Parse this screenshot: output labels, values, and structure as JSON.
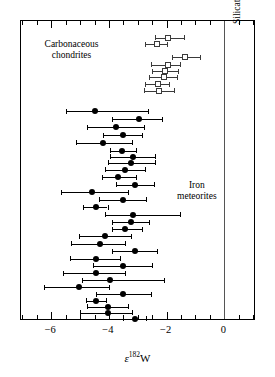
{
  "figure": {
    "background": "#ffffff",
    "frame_color": "#000000"
  },
  "axis": {
    "xlabel_epsilon": "ε",
    "xlabel_superscript": "182",
    "xlabel_element": "W",
    "xlabel_full": "ε182W",
    "tick_labels": [
      "−6",
      "−4",
      "−2",
      "0"
    ],
    "tick_values": [
      -6,
      -4,
      -2,
      0
    ],
    "xlim": [
      -7.05,
      1.1
    ],
    "minor_tick_step": 0.5
  },
  "annotations": {
    "carbonaceous": "Carbonaceous\nchondrites",
    "carbonaceous_line1": "Carbonaceous",
    "carbonaceous_line2": "chondrites",
    "iron": "Iron\nmeteorites",
    "iron_line1": "Iron",
    "iron_line2": "meteorites",
    "silicate_earth": "Silicate Earth"
  },
  "chart_data": {
    "type": "scatter",
    "title": "",
    "xlabel": "ε182W",
    "ylabel": "",
    "xlim": [
      -7.05,
      1.1
    ],
    "ylim": [
      0,
      1
    ],
    "grid": false,
    "legend": "none",
    "reference_lines": [
      {
        "name": "Silicate Earth",
        "x": 0,
        "color": "#555555"
      }
    ],
    "series": [
      {
        "name": "Carbonaceous chondrites",
        "marker": "open-square",
        "color": "#3a3a3a",
        "points": [
          {
            "x": -1.95,
            "y": 0.945,
            "xerr_low": 0.45,
            "xerr_high": 0.55
          },
          {
            "x": -2.35,
            "y": 0.922,
            "xerr_low": 0.4,
            "xerr_high": 0.35
          },
          {
            "x": -1.35,
            "y": 0.88,
            "xerr_low": 0.45,
            "xerr_high": 0.5
          },
          {
            "x": -1.95,
            "y": 0.855,
            "xerr_low": 0.6,
            "xerr_high": 0.4
          },
          {
            "x": -2.05,
            "y": 0.833,
            "xerr_low": 0.45,
            "xerr_high": 0.45
          },
          {
            "x": -2.1,
            "y": 0.812,
            "xerr_low": 0.5,
            "xerr_high": 0.45
          },
          {
            "x": -2.3,
            "y": 0.79,
            "xerr_low": 0.45,
            "xerr_high": 0.4
          },
          {
            "x": -2.25,
            "y": 0.768,
            "xerr_low": 0.55,
            "xerr_high": 0.5
          }
        ]
      },
      {
        "name": "Iron meteorites",
        "marker": "filled-circle",
        "color": "#000000",
        "points": [
          {
            "x": -4.5,
            "y": 0.7,
            "xerr_low": 1.0,
            "xerr_high": 1.85
          },
          {
            "x": -2.95,
            "y": 0.672,
            "xerr_low": 0.95,
            "xerr_high": 0.8
          },
          {
            "x": -3.75,
            "y": 0.646,
            "xerr_low": 1.0,
            "xerr_high": 0.95
          },
          {
            "x": -3.5,
            "y": 0.62,
            "xerr_low": 0.7,
            "xerr_high": 0.65
          },
          {
            "x": -4.2,
            "y": 0.594,
            "xerr_low": 0.95,
            "xerr_high": 1.0
          },
          {
            "x": -3.55,
            "y": 0.568,
            "xerr_low": 0.4,
            "xerr_high": 0.5
          },
          {
            "x": -3.15,
            "y": 0.548,
            "xerr_low": 0.8,
            "xerr_high": 0.75
          },
          {
            "x": -3.25,
            "y": 0.528,
            "xerr_low": 0.8,
            "xerr_high": 0.85
          },
          {
            "x": -3.45,
            "y": 0.505,
            "xerr_low": 0.7,
            "xerr_high": 0.7
          },
          {
            "x": -3.7,
            "y": 0.48,
            "xerr_low": 0.55,
            "xerr_high": 0.65
          },
          {
            "x": -3.1,
            "y": 0.455,
            "xerr_low": 0.65,
            "xerr_high": 0.65
          },
          {
            "x": -4.6,
            "y": 0.43,
            "xerr_low": 1.05,
            "xerr_high": 1.25
          },
          {
            "x": -3.5,
            "y": 0.405,
            "xerr_low": 0.85,
            "xerr_high": 0.8
          },
          {
            "x": -4.45,
            "y": 0.38,
            "xerr_low": 0.45,
            "xerr_high": 0.4
          },
          {
            "x": -3.15,
            "y": 0.355,
            "xerr_low": 1.0,
            "xerr_high": 1.6
          },
          {
            "x": -3.25,
            "y": 0.33,
            "xerr_low": 0.65,
            "xerr_high": 0.65
          },
          {
            "x": -3.45,
            "y": 0.306,
            "xerr_low": 0.45,
            "xerr_high": 0.6
          },
          {
            "x": -4.15,
            "y": 0.282,
            "xerr_low": 0.9,
            "xerr_high": 0.9
          },
          {
            "x": -4.3,
            "y": 0.258,
            "xerr_low": 1.0,
            "xerr_high": 0.85
          },
          {
            "x": -3.1,
            "y": 0.232,
            "xerr_low": 0.8,
            "xerr_high": 0.75
          },
          {
            "x": -4.45,
            "y": 0.208,
            "xerr_low": 0.9,
            "xerr_high": 0.85
          },
          {
            "x": -3.5,
            "y": 0.184,
            "xerr_low": 1.05,
            "xerr_high": 1.0
          },
          {
            "x": -4.45,
            "y": 0.16,
            "xerr_low": 1.15,
            "xerr_high": 1.0
          },
          {
            "x": -3.95,
            "y": 0.136,
            "xerr_low": 1.0,
            "xerr_high": 1.85
          },
          {
            "x": -5.05,
            "y": 0.112,
            "xerr_low": 1.2,
            "xerr_high": 1.05
          },
          {
            "x": -3.5,
            "y": 0.09,
            "xerr_low": 0.95,
            "xerr_high": 0.95
          },
          {
            "x": -4.45,
            "y": 0.068,
            "xerr_low": 0.35,
            "xerr_high": 0.35
          },
          {
            "x": -4.05,
            "y": 0.048,
            "xerr_low": 0.7,
            "xerr_high": 0.7
          },
          {
            "x": -4.05,
            "y": 0.028,
            "xerr_low": 0.95,
            "xerr_high": 0.85
          },
          {
            "x": -3.1,
            "y": 0.008,
            "xerr_low": 0.4,
            "xerr_high": 0.4
          }
        ]
      }
    ]
  }
}
